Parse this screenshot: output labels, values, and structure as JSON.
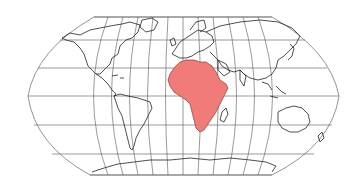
{
  "map": {
    "projection": "Robinson-like world map with graticule",
    "highlighted_region": "Africa",
    "highlight_color": "#f07b78",
    "coastline_color": "#222222",
    "graticule_color": "#555555",
    "background_color": "#ffffff",
    "graticule": {
      "parallels_count": 7,
      "meridians_count": 13
    },
    "regions_shown": [
      "North America",
      "South America",
      "Europe",
      "Asia",
      "Africa",
      "Australia",
      "Antarctica"
    ]
  }
}
